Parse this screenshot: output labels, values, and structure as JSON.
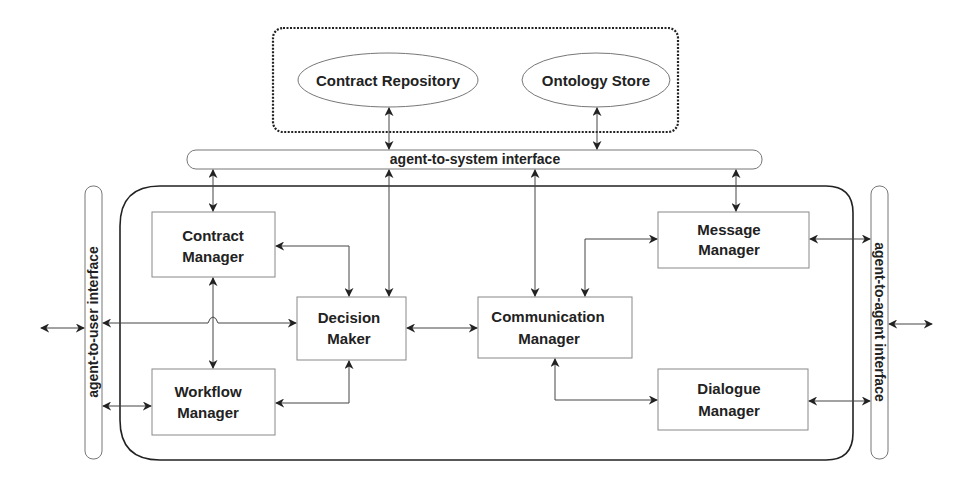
{
  "diagram": {
    "type": "agent-architecture",
    "external_store_group": {
      "items": [
        {
          "id": "contract_repository",
          "label": "Contract Repository",
          "shape": "ellipse"
        },
        {
          "id": "ontology_store",
          "label": "Ontology Store",
          "shape": "ellipse"
        }
      ]
    },
    "interfaces": {
      "agent_to_system": "agent-to-system interface",
      "agent_to_user": "agent-to-user interface",
      "agent_to_agent": "agent-to-agent interface"
    },
    "components": {
      "contract_manager": [
        "Contract",
        "Manager"
      ],
      "workflow_manager": [
        "Workflow",
        "Manager"
      ],
      "decision_maker": [
        "Decision",
        "Maker"
      ],
      "communication_manager": [
        "Communication",
        "Manager"
      ],
      "message_manager": [
        "Message",
        "Manager"
      ],
      "dialogue_manager": [
        "Dialogue",
        "Manager"
      ]
    },
    "edges": [
      {
        "from": "contract_repository",
        "to": "agent_to_system",
        "bidirectional": true
      },
      {
        "from": "ontology_store",
        "to": "agent_to_system",
        "bidirectional": true
      },
      {
        "from": "agent_to_system",
        "to": "contract_manager",
        "bidirectional": true
      },
      {
        "from": "agent_to_system",
        "to": "decision_maker",
        "bidirectional": true
      },
      {
        "from": "agent_to_system",
        "to": "communication_manager",
        "bidirectional": true
      },
      {
        "from": "agent_to_system",
        "to": "message_manager",
        "bidirectional": true
      },
      {
        "from": "decision_maker",
        "to": "contract_manager",
        "bidirectional": true
      },
      {
        "from": "decision_maker",
        "to": "workflow_manager",
        "bidirectional": true
      },
      {
        "from": "contract_manager",
        "to": "workflow_manager",
        "bidirectional": true
      },
      {
        "from": "agent_to_user",
        "to": "decision_maker",
        "bidirectional": true
      },
      {
        "from": "agent_to_user",
        "to": "workflow_manager",
        "bidirectional": true
      },
      {
        "from": "decision_maker",
        "to": "communication_manager",
        "bidirectional": true
      },
      {
        "from": "communication_manager",
        "to": "message_manager",
        "bidirectional": true
      },
      {
        "from": "communication_manager",
        "to": "dialogue_manager",
        "bidirectional": true
      },
      {
        "from": "message_manager",
        "to": "agent_to_agent",
        "bidirectional": true
      },
      {
        "from": "dialogue_manager",
        "to": "agent_to_agent",
        "bidirectional": true
      },
      {
        "from": "external_user",
        "to": "agent_to_user",
        "bidirectional": true
      },
      {
        "from": "agent_to_agent",
        "to": "external_agent",
        "bidirectional": true
      }
    ]
  }
}
